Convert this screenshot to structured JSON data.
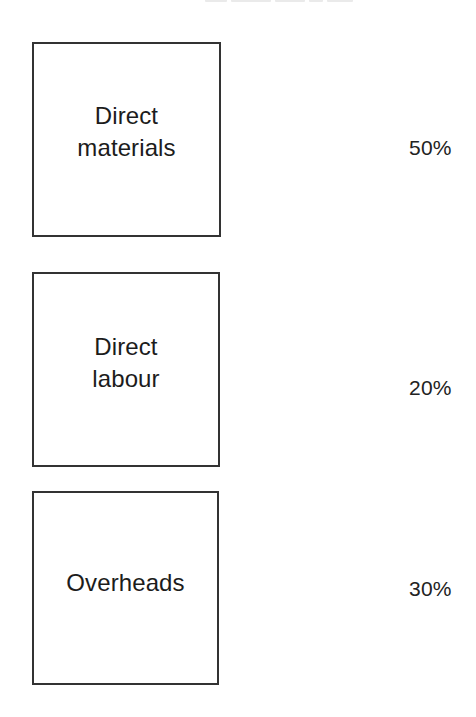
{
  "diagram": {
    "title_cutoff": "",
    "items": [
      {
        "label": "Direct\nmaterials",
        "percentage": "50%",
        "box": {
          "left": 32,
          "top": 42,
          "width": 189,
          "height": 195
        },
        "label_offset_y": -8,
        "pct_pos": {
          "left": 409,
          "top": 136
        }
      },
      {
        "label": "Direct\nlabour",
        "percentage": "20%",
        "box": {
          "left": 32,
          "top": 272,
          "width": 188,
          "height": 195
        },
        "label_offset_y": -7,
        "pct_pos": {
          "left": 409,
          "top": 376
        }
      },
      {
        "label": "Overheads",
        "percentage": "30%",
        "box": {
          "left": 32,
          "top": 491,
          "width": 187,
          "height": 194
        },
        "label_offset_y": -5,
        "pct_pos": {
          "left": 409,
          "top": 577
        }
      }
    ]
  },
  "colors": {
    "background": "#ffffff",
    "border": "#333333",
    "text": "#1c1c1c"
  }
}
